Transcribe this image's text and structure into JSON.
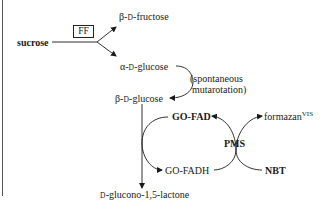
{
  "diagram": {
    "enzyme_box": "FF",
    "nodes": {
      "sucrose": "sucrose",
      "beta_fructose": {
        "prefix": "β-",
        "d": "D",
        "suffix": "-fructose"
      },
      "alpha_glucose": {
        "prefix": "α-",
        "d": "D",
        "suffix": "-glucose"
      },
      "beta_glucose": {
        "prefix": "β-",
        "d": "D",
        "suffix": "-glucose"
      },
      "lactone": {
        "d": "D",
        "suffix": "-glucono-1,5-lactone"
      },
      "go_fad": "GO-FAD",
      "go_fadh": "GO-FADH",
      "pms": "PMS",
      "nbt": "NBT",
      "formazan": {
        "text": "formazan",
        "sup": "VIS"
      }
    },
    "annotations": {
      "mutarotation_line1": "(spontaneous",
      "mutarotation_line2": "mutarotation)"
    },
    "colors": {
      "ink": "#1a1a1a",
      "background": "#ffffff"
    }
  }
}
